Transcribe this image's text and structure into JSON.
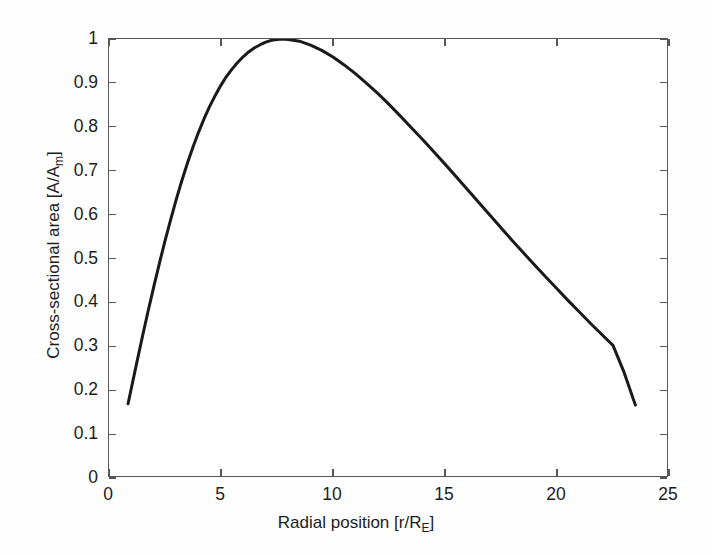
{
  "figure": {
    "background_color": "#fefefe",
    "plot_background_color": "#ffffff",
    "axis_color": "#57575a",
    "curve_color": "#1a1a1a"
  },
  "axes": {
    "x_title_prefix": "Radial position [r/R",
    "x_title_sub": "E",
    "x_title_suffix": "]",
    "y_title_prefix": "Cross-sectional area [A/A",
    "y_title_sub": "m",
    "y_title_suffix": "]",
    "x_tick_labels": [
      "0",
      "5",
      "10",
      "15",
      "20",
      "25"
    ],
    "y_tick_labels": [
      "0",
      "0.1",
      "0.2",
      "0.3",
      "0.4",
      "0.5",
      "0.6",
      "0.7",
      "0.8",
      "0.9",
      "1"
    ]
  },
  "chart_data": {
    "type": "line",
    "title": "",
    "xlabel": "Radial position [r/R_E]",
    "ylabel": "Cross-sectional area [A/A_m]",
    "xlim": [
      0,
      25
    ],
    "ylim": [
      0,
      1
    ],
    "xticks": [
      0,
      5,
      10,
      15,
      20,
      25
    ],
    "yticks": [
      0,
      0.1,
      0.2,
      0.3,
      0.4,
      0.5,
      0.6,
      0.7,
      0.8,
      0.9,
      1
    ],
    "grid": false,
    "legend": null,
    "line_width": 3,
    "line_color": "#1a1a1a",
    "series": [
      {
        "name": "A/A_m",
        "x": [
          0.85,
          1.0,
          1.25,
          1.5,
          1.75,
          2.0,
          2.25,
          2.5,
          2.75,
          3.0,
          3.25,
          3.5,
          3.75,
          4.0,
          4.25,
          4.5,
          4.75,
          5.0,
          5.25,
          5.5,
          5.75,
          6.0,
          6.25,
          6.5,
          6.75,
          7.0,
          7.25,
          7.5,
          7.75,
          8.0,
          8.5,
          9.0,
          9.5,
          10.0,
          10.5,
          11.0,
          11.5,
          12.0,
          12.5,
          13.0,
          13.5,
          14.0,
          14.5,
          15.0,
          15.5,
          16.0,
          16.5,
          17.0,
          17.5,
          18.0,
          18.5,
          19.0,
          19.5,
          20.0,
          20.5,
          21.0,
          21.5,
          22.0,
          22.5,
          23.0,
          23.5
        ],
        "y": [
          0.169,
          0.205,
          0.265,
          0.324,
          0.381,
          0.436,
          0.489,
          0.54,
          0.588,
          0.634,
          0.677,
          0.717,
          0.754,
          0.788,
          0.819,
          0.847,
          0.872,
          0.895,
          0.915,
          0.932,
          0.947,
          0.96,
          0.971,
          0.98,
          0.987,
          0.993,
          0.997,
          0.999,
          1.0,
          0.999,
          0.995,
          0.986,
          0.974,
          0.959,
          0.941,
          0.921,
          0.899,
          0.876,
          0.851,
          0.825,
          0.798,
          0.771,
          0.743,
          0.715,
          0.686,
          0.657,
          0.628,
          0.599,
          0.57,
          0.541,
          0.513,
          0.485,
          0.458,
          0.431,
          0.404,
          0.378,
          0.352,
          0.327,
          0.302,
          0.24,
          0.166
        ]
      }
    ]
  }
}
